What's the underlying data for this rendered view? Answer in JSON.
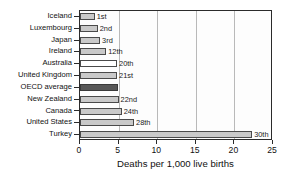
{
  "chart_data": {
    "type": "bar",
    "orientation": "horizontal",
    "title": "",
    "xlabel": "Deaths per 1,000 live births",
    "ylabel": "",
    "xlim": [
      0,
      25
    ],
    "xticks": [
      "0",
      "5",
      "10",
      "15",
      "20",
      "25"
    ],
    "grid": "vertical",
    "legend": "none",
    "categories": [
      "Iceland",
      "Luxembourg",
      "Japan",
      "Ireland",
      "Australia",
      "United Kingdom",
      "OECD average",
      "New Zealand",
      "Canada",
      "United States",
      "Turkey"
    ],
    "values": [
      1.9,
      2.3,
      2.6,
      3.4,
      4.8,
      4.8,
      4.9,
      5.0,
      5.4,
      7.0,
      22.3
    ],
    "point_labels": [
      "1st",
      "2nd",
      "3rd",
      "12th",
      "20th",
      "21st",
      "",
      "22nd",
      "24th",
      "28th",
      "30th"
    ],
    "bar_styles": [
      "gray",
      "gray",
      "gray",
      "gray",
      "white",
      "gray",
      "dark",
      "gray",
      "gray",
      "gray",
      "gray"
    ],
    "colors": {
      "bar_gray": "#c9c9c9",
      "bar_white": "#ffffff",
      "bar_dark": "#575757",
      "bar_border": "#4a4a4a",
      "gridline": "#b9b9b9",
      "axis": "#2b2b2b",
      "text": "#111111",
      "plot_background": "#fdfdfd"
    }
  }
}
